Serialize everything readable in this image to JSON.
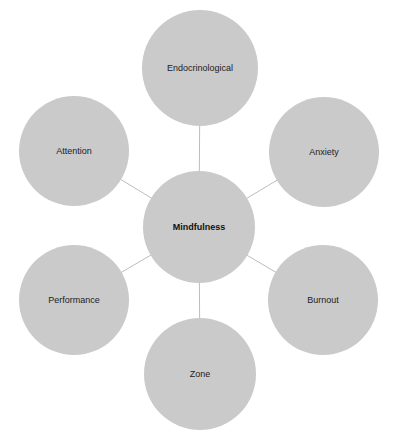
{
  "diagram": {
    "center": {
      "label": "Mindfulness",
      "x": 199,
      "y": 227,
      "r": 56
    },
    "nodes": [
      {
        "label": "Endocrinological",
        "x": 200,
        "y": 68,
        "r": 58
      },
      {
        "label": "Anxiety",
        "x": 324,
        "y": 152,
        "r": 55
      },
      {
        "label": "Burnout",
        "x": 323,
        "y": 300,
        "r": 55
      },
      {
        "label": "Zone",
        "x": 200,
        "y": 374,
        "r": 56
      },
      {
        "label": "Performance",
        "x": 74,
        "y": 300,
        "r": 55
      },
      {
        "label": "Attention",
        "x": 74,
        "y": 151,
        "r": 55
      }
    ],
    "colors": {
      "fill": "#cacaca",
      "line": "#bdbdbd",
      "text": "#222222"
    }
  }
}
